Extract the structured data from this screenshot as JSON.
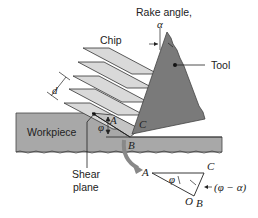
{
  "figure": {
    "labels": {
      "rake_angle": "Rake angle,",
      "alpha": "α",
      "chip": "Chip",
      "tool": "Tool",
      "d": "d",
      "workpiece": "Workpiece",
      "shear_plane_line1": "Shear",
      "shear_plane_line2": "plane",
      "phi": "φ",
      "A": "A",
      "B": "B",
      "C": "C"
    },
    "inset": {
      "A": "A",
      "B": "B",
      "C": "C",
      "O": "O",
      "phi": "φ",
      "phi_minus_alpha": "(φ − α)"
    },
    "colors": {
      "tool": "#7a7a7a",
      "chip": "#d9d9d9",
      "workpiece": "#a8a8a8",
      "stroke": "#222222"
    }
  }
}
